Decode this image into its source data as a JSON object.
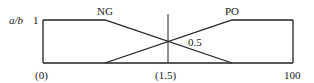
{
  "diagram": {
    "y_axis_label": "a/b",
    "y_tick_top": "1",
    "labels": {
      "ng": "NG",
      "po": "PO",
      "crossing_value": "0.5"
    },
    "x_ticks": {
      "left": "(0)",
      "middle": "(1.5)",
      "right": "100"
    },
    "line_color": "#222222"
  }
}
